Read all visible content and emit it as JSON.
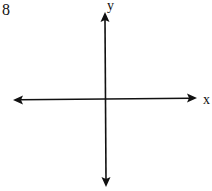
{
  "problem": {
    "number": "8"
  },
  "axes": {
    "x_label": "x",
    "y_label": "y",
    "x_axis": {
      "x1": 13,
      "y1": 100,
      "x2": 197,
      "y2": 98,
      "arrows": "both"
    },
    "y_axis": {
      "x1": 105,
      "y1": 12,
      "x2": 106,
      "y2": 187,
      "arrows": "both"
    },
    "stroke_color": "#111111"
  }
}
